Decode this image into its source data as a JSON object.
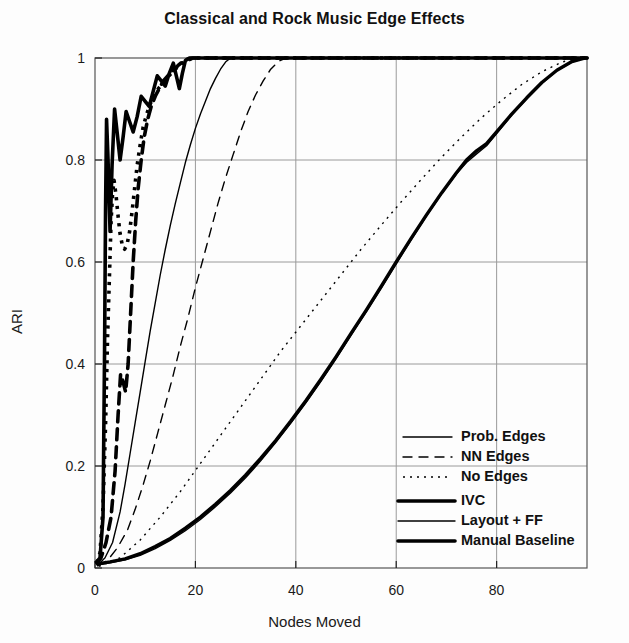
{
  "chart_data": {
    "type": "line",
    "title": "Classical and Rock Music Edge Effects",
    "xlabel": "Nodes Moved",
    "ylabel": "ARI",
    "xlim": [
      0,
      98
    ],
    "ylim": [
      0,
      1
    ],
    "xticks": [
      0,
      20,
      40,
      60,
      80
    ],
    "yticks": [
      0,
      0.2,
      0.4,
      0.6,
      0.8,
      1
    ],
    "grid": true,
    "legend_position": "lower-right inside plot",
    "series": [
      {
        "name": "IVC",
        "group": "thick",
        "style": "solid",
        "width": 3.6,
        "color": "#000000",
        "points": [
          [
            0.3,
            0.012
          ],
          [
            1.0,
            0.02
          ],
          [
            1.6,
            0.1
          ],
          [
            1.9,
            0.42
          ],
          [
            2.1,
            0.7
          ],
          [
            2.3,
            0.88
          ],
          [
            2.6,
            0.8
          ],
          [
            3.0,
            0.66
          ],
          [
            3.4,
            0.79
          ],
          [
            3.9,
            0.9
          ],
          [
            4.4,
            0.855
          ],
          [
            5.0,
            0.8
          ],
          [
            5.6,
            0.845
          ],
          [
            6.2,
            0.895
          ],
          [
            6.9,
            0.875
          ],
          [
            7.6,
            0.855
          ],
          [
            8.4,
            0.885
          ],
          [
            9.2,
            0.925
          ],
          [
            10.0,
            0.915
          ],
          [
            10.8,
            0.905
          ],
          [
            11.6,
            0.935
          ],
          [
            12.4,
            0.965
          ],
          [
            13.2,
            0.955
          ],
          [
            14.0,
            0.945
          ],
          [
            14.8,
            0.97
          ],
          [
            15.6,
            0.99
          ],
          [
            16.2,
            0.965
          ],
          [
            16.8,
            0.94
          ],
          [
            17.4,
            0.97
          ],
          [
            18.0,
            0.995
          ],
          [
            18.8,
            1.0
          ],
          [
            20.0,
            1.0
          ],
          [
            40.0,
            1.0
          ],
          [
            60.0,
            1.0
          ],
          [
            80.0,
            1.0
          ],
          [
            98.0,
            1.0
          ]
        ]
      },
      {
        "name": "NN Edges",
        "group": "thick",
        "style": "dashed",
        "width": 3.6,
        "color": "#000000",
        "points": [
          [
            0.4,
            0.01
          ],
          [
            1.2,
            0.02
          ],
          [
            2.2,
            0.05
          ],
          [
            3.2,
            0.1
          ],
          [
            4.0,
            0.19
          ],
          [
            4.6,
            0.3
          ],
          [
            5.1,
            0.38
          ],
          [
            5.6,
            0.365
          ],
          [
            6.1,
            0.345
          ],
          [
            6.6,
            0.4
          ],
          [
            7.1,
            0.5
          ],
          [
            7.6,
            0.6
          ],
          [
            8.1,
            0.68
          ],
          [
            8.6,
            0.745
          ],
          [
            9.2,
            0.8
          ],
          [
            9.8,
            0.845
          ],
          [
            10.5,
            0.88
          ],
          [
            11.2,
            0.905
          ],
          [
            12.0,
            0.925
          ],
          [
            12.8,
            0.94
          ],
          [
            13.6,
            0.955
          ],
          [
            14.5,
            0.965
          ],
          [
            15.5,
            0.975
          ],
          [
            16.5,
            0.985
          ],
          [
            17.5,
            0.993
          ],
          [
            18.5,
            0.998
          ],
          [
            19.5,
            1.0
          ],
          [
            22.0,
            1.0
          ],
          [
            40.0,
            1.0
          ],
          [
            70.0,
            1.0
          ],
          [
            98.0,
            1.0
          ]
        ]
      },
      {
        "name": "No Edges",
        "group": "thick",
        "style": "dotted",
        "width": 3.6,
        "color": "#000000",
        "points": [
          [
            0.4,
            0.01
          ],
          [
            1.0,
            0.03
          ],
          [
            1.6,
            0.12
          ],
          [
            2.1,
            0.28
          ],
          [
            2.5,
            0.45
          ],
          [
            2.9,
            0.58
          ],
          [
            3.2,
            0.68
          ],
          [
            3.5,
            0.735
          ],
          [
            3.8,
            0.76
          ],
          [
            4.2,
            0.73
          ],
          [
            4.6,
            0.69
          ],
          [
            5.0,
            0.655
          ],
          [
            5.4,
            0.635
          ],
          [
            5.9,
            0.625
          ],
          [
            6.4,
            0.635
          ],
          [
            6.9,
            0.66
          ],
          [
            7.4,
            0.7
          ],
          [
            7.9,
            0.745
          ],
          [
            8.4,
            0.79
          ],
          [
            9.0,
            0.83
          ],
          [
            9.6,
            0.865
          ],
          [
            10.3,
            0.89
          ],
          [
            11.0,
            0.91
          ],
          [
            11.8,
            0.925
          ],
          [
            12.6,
            0.94
          ],
          [
            13.5,
            0.95
          ],
          [
            14.4,
            0.962
          ],
          [
            15.4,
            0.972
          ],
          [
            16.4,
            0.982
          ],
          [
            17.4,
            0.99
          ],
          [
            18.5,
            0.996
          ],
          [
            19.6,
            1.0
          ],
          [
            23.0,
            1.0
          ],
          [
            45.0,
            1.0
          ],
          [
            75.0,
            1.0
          ],
          [
            98.0,
            1.0
          ]
        ]
      },
      {
        "name": "Prob. Edges",
        "group": "thin",
        "style": "solid",
        "width": 1.4,
        "color": "#000000",
        "points": [
          [
            0.5,
            0.005
          ],
          [
            2.0,
            0.02
          ],
          [
            3.5,
            0.05
          ],
          [
            5.0,
            0.11
          ],
          [
            6.0,
            0.165
          ],
          [
            7.0,
            0.225
          ],
          [
            8.0,
            0.285
          ],
          [
            9.0,
            0.345
          ],
          [
            10.0,
            0.405
          ],
          [
            11.0,
            0.465
          ],
          [
            12.0,
            0.52
          ],
          [
            13.0,
            0.575
          ],
          [
            14.0,
            0.625
          ],
          [
            15.0,
            0.672
          ],
          [
            16.0,
            0.715
          ],
          [
            17.0,
            0.755
          ],
          [
            18.0,
            0.795
          ],
          [
            19.0,
            0.83
          ],
          [
            20.0,
            0.862
          ],
          [
            21.0,
            0.89
          ],
          [
            22.0,
            0.915
          ],
          [
            23.0,
            0.94
          ],
          [
            24.0,
            0.96
          ],
          [
            25.0,
            0.978
          ],
          [
            26.0,
            0.992
          ],
          [
            27.0,
            1.0
          ],
          [
            30.0,
            1.0
          ],
          [
            50.0,
            1.0
          ],
          [
            75.0,
            1.0
          ],
          [
            98.0,
            1.0
          ]
        ]
      },
      {
        "name": "NN Edges (thin)",
        "group": "thin",
        "style": "dashed",
        "width": 1.4,
        "color": "#000000",
        "points": [
          [
            0.6,
            0.004
          ],
          [
            2.5,
            0.015
          ],
          [
            4.5,
            0.04
          ],
          [
            6.5,
            0.075
          ],
          [
            8.0,
            0.115
          ],
          [
            9.5,
            0.16
          ],
          [
            11.0,
            0.21
          ],
          [
            12.5,
            0.265
          ],
          [
            14.0,
            0.32
          ],
          [
            15.5,
            0.375
          ],
          [
            17.0,
            0.435
          ],
          [
            18.5,
            0.49
          ],
          [
            20.0,
            0.55
          ],
          [
            21.5,
            0.605
          ],
          [
            23.0,
            0.66
          ],
          [
            24.5,
            0.715
          ],
          [
            26.0,
            0.765
          ],
          [
            27.5,
            0.81
          ],
          [
            29.0,
            0.855
          ],
          [
            30.5,
            0.895
          ],
          [
            32.0,
            0.928
          ],
          [
            33.5,
            0.955
          ],
          [
            35.0,
            0.978
          ],
          [
            36.5,
            0.993
          ],
          [
            38.0,
            1.0
          ],
          [
            42.0,
            1.0
          ],
          [
            65.0,
            1.0
          ],
          [
            98.0,
            1.0
          ]
        ]
      },
      {
        "name": "No Edges (thin)",
        "group": "thin",
        "style": "dotted",
        "width": 1.4,
        "color": "#000000",
        "points": [
          [
            0.8,
            0.003
          ],
          [
            5.0,
            0.02
          ],
          [
            9.0,
            0.055
          ],
          [
            13.0,
            0.1
          ],
          [
            17.0,
            0.15
          ],
          [
            21.0,
            0.205
          ],
          [
            25.0,
            0.26
          ],
          [
            29.0,
            0.315
          ],
          [
            33.0,
            0.37
          ],
          [
            37.0,
            0.425
          ],
          [
            41.0,
            0.475
          ],
          [
            45.0,
            0.525
          ],
          [
            49.0,
            0.575
          ],
          [
            53.0,
            0.625
          ],
          [
            57.0,
            0.672
          ],
          [
            61.0,
            0.718
          ],
          [
            65.0,
            0.762
          ],
          [
            69.0,
            0.805
          ],
          [
            73.0,
            0.845
          ],
          [
            77.0,
            0.883
          ],
          [
            81.0,
            0.917
          ],
          [
            85.0,
            0.948
          ],
          [
            89.0,
            0.973
          ],
          [
            93.0,
            0.992
          ],
          [
            96.0,
            1.0
          ],
          [
            98.0,
            1.0
          ]
        ]
      },
      {
        "name": "Manual Baseline",
        "group": "baseline",
        "style": "solid",
        "width": 3.4,
        "color": "#000000",
        "points": [
          [
            0.5,
            0.008
          ],
          [
            3.0,
            0.012
          ],
          [
            6.0,
            0.018
          ],
          [
            9.0,
            0.028
          ],
          [
            12.0,
            0.042
          ],
          [
            15.0,
            0.058
          ],
          [
            18.0,
            0.078
          ],
          [
            21.0,
            0.1
          ],
          [
            24.0,
            0.125
          ],
          [
            27.0,
            0.152
          ],
          [
            30.0,
            0.182
          ],
          [
            33.0,
            0.215
          ],
          [
            36.0,
            0.25
          ],
          [
            39.0,
            0.288
          ],
          [
            42.0,
            0.328
          ],
          [
            45.0,
            0.37
          ],
          [
            48.0,
            0.414
          ],
          [
            51.0,
            0.46
          ],
          [
            54.0,
            0.505
          ],
          [
            57.0,
            0.552
          ],
          [
            60.0,
            0.6
          ],
          [
            63.0,
            0.647
          ],
          [
            66.0,
            0.692
          ],
          [
            69.0,
            0.735
          ],
          [
            72.0,
            0.775
          ],
          [
            74.0,
            0.8
          ],
          [
            76.0,
            0.818
          ],
          [
            78.0,
            0.832
          ],
          [
            80.0,
            0.855
          ],
          [
            83.0,
            0.89
          ],
          [
            86.0,
            0.922
          ],
          [
            89.0,
            0.952
          ],
          [
            92.0,
            0.976
          ],
          [
            95.0,
            0.993
          ],
          [
            97.5,
            1.0
          ]
        ]
      },
      {
        "name": "Layout + FF",
        "group": "baseline",
        "style": "solid-thin-overlap",
        "width": 1.4,
        "color": "#000000",
        "points": [
          [
            0.5,
            0.006
          ],
          [
            3.0,
            0.01
          ],
          [
            6.0,
            0.016
          ],
          [
            9.0,
            0.025
          ],
          [
            12.0,
            0.038
          ],
          [
            15.0,
            0.054
          ],
          [
            18.0,
            0.073
          ],
          [
            21.0,
            0.095
          ],
          [
            24.0,
            0.12
          ],
          [
            27.0,
            0.147
          ],
          [
            30.0,
            0.177
          ],
          [
            33.0,
            0.21
          ],
          [
            36.0,
            0.246
          ],
          [
            39.0,
            0.284
          ],
          [
            42.0,
            0.324
          ],
          [
            45.0,
            0.366
          ],
          [
            48.0,
            0.41
          ],
          [
            51.0,
            0.456
          ],
          [
            54.0,
            0.502
          ],
          [
            57.0,
            0.549
          ],
          [
            60.0,
            0.597
          ],
          [
            63.0,
            0.644
          ],
          [
            66.0,
            0.69
          ],
          [
            69.0,
            0.733
          ],
          [
            72.0,
            0.773
          ],
          [
            74.0,
            0.795
          ],
          [
            76.0,
            0.812
          ],
          [
            78.0,
            0.828
          ],
          [
            80.0,
            0.852
          ],
          [
            83.0,
            0.888
          ],
          [
            86.0,
            0.92
          ],
          [
            89.0,
            0.95
          ],
          [
            92.0,
            0.975
          ],
          [
            95.0,
            0.992
          ],
          [
            97.5,
            1.0
          ]
        ]
      }
    ]
  },
  "axes": {
    "ytick_labels": [
      "1",
      "0.8",
      "0.6",
      "0.4",
      "0.2",
      "0"
    ],
    "ytick_values": [
      1,
      0.8,
      0.6,
      0.4,
      0.2,
      0
    ],
    "xtick_labels": [
      "0",
      "20",
      "40",
      "60",
      "80"
    ],
    "xtick_values": [
      0,
      20,
      40,
      60,
      80
    ]
  },
  "legend": {
    "group_a": [
      {
        "label": "Prob. Edges",
        "style": "solid",
        "weight": "thin"
      },
      {
        "label": "NN Edges",
        "style": "dashed",
        "weight": "thin"
      },
      {
        "label": "No Edges",
        "style": "dotted",
        "weight": "thin"
      }
    ],
    "group_b": [
      {
        "label": "IVC",
        "style": "solid",
        "weight": "thick"
      },
      {
        "label": "Layout + FF",
        "style": "solid",
        "weight": "thin"
      },
      {
        "label": "Manual Baseline",
        "style": "solid",
        "weight": "thick"
      }
    ]
  },
  "colors": {
    "ink": "#000000",
    "grid": "#9a9a9a",
    "frame": "#555555",
    "background": "#fdfdfd"
  }
}
